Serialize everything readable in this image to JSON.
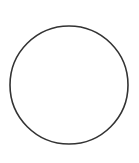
{
  "canvas": {
    "width": 139,
    "height": 163,
    "background": "#ffffff"
  },
  "shape": {
    "type": "circle",
    "cx": 69,
    "cy": 85,
    "r": 59,
    "stroke": "#333333",
    "stroke_width": 1.6,
    "fill": "none"
  }
}
